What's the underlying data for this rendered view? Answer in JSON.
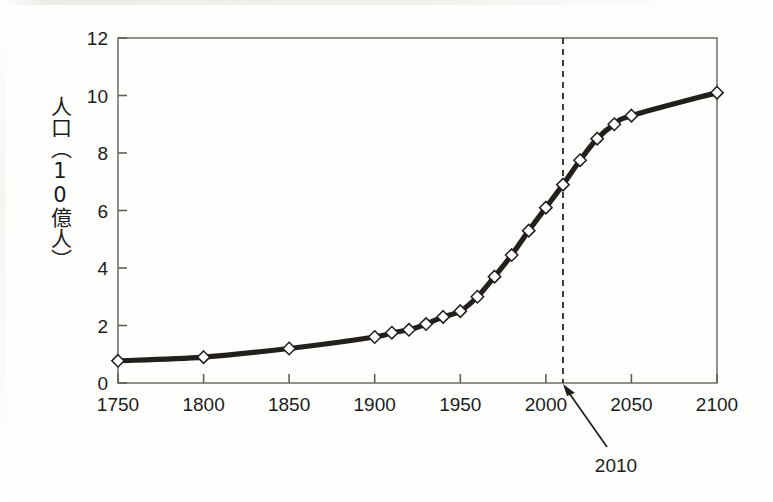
{
  "figure": {
    "background_color": "#fefefd",
    "ink_color": "#1c1c1c",
    "axis_color": "#6e6e68",
    "curve_color": "#231f1c",
    "marker_fill": "#ffffff"
  },
  "chart_data": {
    "type": "line",
    "title": "",
    "xlabel": "",
    "ylabel": "人口（10億人）",
    "ylabel_chars": [
      "人",
      "口",
      "（",
      "1",
      "0",
      "億",
      "人",
      "）"
    ],
    "xlim": [
      1750,
      2100
    ],
    "ylim": [
      0,
      12
    ],
    "xticks": [
      1750,
      1800,
      1850,
      1900,
      1950,
      2000,
      2050,
      2100
    ],
    "xtick_labels": [
      "1750",
      "1800",
      "1850",
      "1900",
      "1950",
      "2000",
      "2050",
      "2100"
    ],
    "yticks": [
      0,
      2,
      4,
      6,
      8,
      10,
      12
    ],
    "ytick_labels": [
      "0",
      "2",
      "4",
      "6",
      "8",
      "10",
      "12"
    ],
    "grid": false,
    "legend": null,
    "marker": "open-diamond",
    "series": [
      {
        "name": "world-population",
        "x": [
          1750,
          1800,
          1850,
          1900,
          1910,
          1920,
          1930,
          1940,
          1950,
          1960,
          1970,
          1980,
          1990,
          2000,
          2010,
          2020,
          2030,
          2040,
          2050,
          2100
        ],
        "values": [
          0.77,
          0.9,
          1.2,
          1.6,
          1.75,
          1.85,
          2.05,
          2.3,
          2.5,
          3.0,
          3.7,
          4.45,
          5.3,
          6.1,
          6.9,
          7.75,
          8.5,
          9.0,
          9.3,
          10.1
        ]
      }
    ],
    "annotations": [
      {
        "name": "year-2010-marker",
        "label": "2010",
        "x": 2010,
        "style": "dashed-vertical-line-with-arrow",
        "line_from_y": 12,
        "line_to_y": 0
      }
    ]
  }
}
